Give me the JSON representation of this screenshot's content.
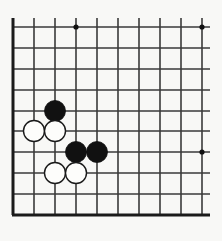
{
  "board": {
    "kind": "go-board-diagram",
    "description": "Go board corner diagram showing a joseki fight with black and white stones",
    "background_color": "#f8f8f6",
    "page_background_color": "#ffffff",
    "line_color": "#3a3a3a",
    "edge_color": "#1a1a1a",
    "line_width": 1.6,
    "edge_width": 3.0,
    "grid": {
      "columns": 10,
      "rows": 10,
      "spacing": 21,
      "origin_x": 13,
      "origin_y": 27,
      "column_x": [
        13,
        34,
        55,
        76,
        97,
        118,
        139,
        160,
        181,
        202
      ],
      "row_y": [
        27,
        48,
        69,
        90,
        111,
        131,
        152,
        173,
        194,
        215
      ]
    },
    "edges": {
      "top": false,
      "left": true,
      "bottom": true,
      "right": false,
      "top_inner_rule": true
    },
    "star_points": [
      {
        "name": "star-point-top-left",
        "x": 76,
        "y": 27,
        "radius": 2.6
      },
      {
        "name": "star-point-top-right",
        "x": 202,
        "y": 27,
        "radius": 2.6
      },
      {
        "name": "star-point-right-middle",
        "x": 202,
        "y": 152,
        "radius": 2.6
      }
    ],
    "star_point_color": "#111111",
    "stones": [
      {
        "id": "black-1",
        "color": "black",
        "x": 55,
        "y": 111,
        "radius": 10.5,
        "fill": "#111111",
        "stroke": "#111111"
      },
      {
        "id": "white-1",
        "color": "white",
        "x": 34,
        "y": 131,
        "radius": 10.5,
        "fill": "#fdfdfb",
        "stroke": "#1a1a1a"
      },
      {
        "id": "white-2",
        "color": "white",
        "x": 55,
        "y": 131,
        "radius": 10.5,
        "fill": "#fdfdfb",
        "stroke": "#1a1a1a"
      },
      {
        "id": "black-2",
        "color": "black",
        "x": 76,
        "y": 152,
        "radius": 10.5,
        "fill": "#111111",
        "stroke": "#111111"
      },
      {
        "id": "black-3",
        "color": "black",
        "x": 97,
        "y": 152,
        "radius": 10.5,
        "fill": "#111111",
        "stroke": "#111111"
      },
      {
        "id": "white-3",
        "color": "white",
        "x": 55,
        "y": 173,
        "radius": 10.5,
        "fill": "#fdfdfb",
        "stroke": "#1a1a1a"
      },
      {
        "id": "white-4",
        "color": "white",
        "x": 76,
        "y": 173,
        "radius": 10.5,
        "fill": "#fdfdfb",
        "stroke": "#1a1a1a"
      }
    ],
    "stone_counts": {
      "black": 3,
      "white": 4
    }
  }
}
